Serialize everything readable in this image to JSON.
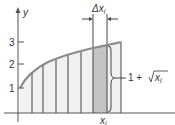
{
  "figure": {
    "y_axis_label": "y",
    "x_axis_label": "",
    "y_ticks": [
      {
        "label": "1",
        "y": 88
      },
      {
        "label": "2",
        "y": 64
      },
      {
        "label": "3",
        "y": 42
      }
    ],
    "delta_label": "Δx",
    "delta_subscript": "i",
    "brace_label_prefix": "1 + ",
    "brace_label_root": "x",
    "brace_label_subscript": "i",
    "xi_label": "x",
    "xi_subscript": "i",
    "colors": {
      "axis": "#555555",
      "curve": "#8a8a8a",
      "fill": "#f1f1f1",
      "shaded_strip": "#c4c4c4",
      "strip_line": "#444444"
    },
    "strip_edges_px": [
      20,
      32,
      43,
      56,
      68,
      81,
      93,
      107,
      121
    ]
  }
}
